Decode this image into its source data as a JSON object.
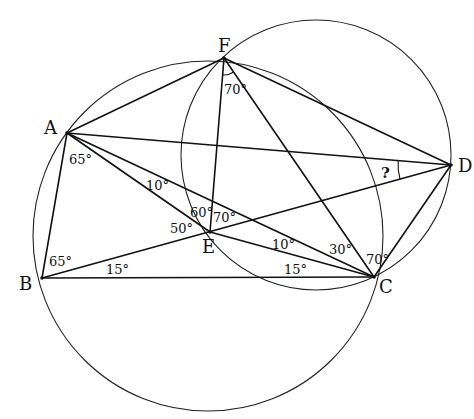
{
  "diagram": {
    "points": {
      "A": {
        "label": "A",
        "x": 67,
        "y": 133
      },
      "B": {
        "label": "B",
        "x": 42,
        "y": 278
      },
      "C": {
        "label": "C",
        "x": 374,
        "y": 277
      },
      "D": {
        "label": "D",
        "x": 451,
        "y": 165
      },
      "E": {
        "label": "E",
        "x": 210,
        "y": 232
      },
      "F": {
        "label": "F",
        "x": 224,
        "y": 58
      }
    },
    "circles": [
      {
        "name": "circle-ABCF",
        "cx": 208,
        "cy": 236,
        "r": 175
      },
      {
        "name": "circle-FDCE",
        "cx": 316,
        "cy": 155,
        "r": 135
      }
    ],
    "segments": [
      "AF",
      "FD",
      "AD",
      "AB",
      "BC",
      "BD",
      "AE",
      "AC",
      "EC",
      "FE",
      "FC",
      "CD"
    ],
    "angles": {
      "A_BAE": "65°",
      "A_EAC": "10°",
      "B_ABD": "65°",
      "B_DBC": "15°",
      "E_AEB": "50°",
      "E_AEF": "60°",
      "E_FED": "70°",
      "C_ECB": "15°",
      "C_ACE": "10°",
      "C_FCA": "30°",
      "C_DCF": "70°",
      "F_EFC": "70°",
      "D_unknown": "?"
    },
    "stroke_color": "#111111",
    "background": "#ffffff"
  }
}
